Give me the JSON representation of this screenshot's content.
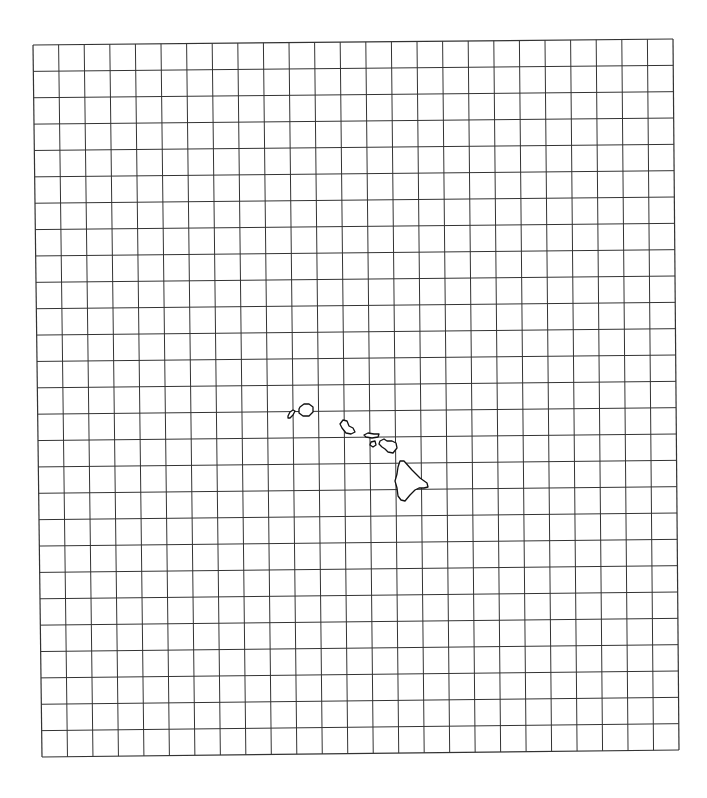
{
  "map": {
    "title": "",
    "background": "#ffffff",
    "grid": {
      "columns": 25,
      "rows": 27,
      "line_color": "#333333",
      "corners": {
        "top_left": [
          33,
          45
        ],
        "top_right": [
          673,
          39
        ],
        "bottom_left": [
          42,
          757
        ],
        "bottom_right": [
          679,
          750
        ]
      }
    },
    "islands": [
      {
        "name": "Niihau",
        "points": [
          [
            288,
            416
          ],
          [
            290,
            412
          ],
          [
            293,
            410
          ],
          [
            295,
            411
          ],
          [
            293,
            415
          ],
          [
            290,
            418
          ],
          [
            288,
            418
          ]
        ]
      },
      {
        "name": "Kauai",
        "points": [
          [
            300,
            407
          ],
          [
            304,
            404
          ],
          [
            309,
            404
          ],
          [
            313,
            407
          ],
          [
            313,
            412
          ],
          [
            309,
            416
          ],
          [
            303,
            416
          ],
          [
            299,
            413
          ],
          [
            299,
            409
          ]
        ]
      },
      {
        "name": "Oahu",
        "points": [
          [
            343,
            420
          ],
          [
            347,
            421
          ],
          [
            349,
            426
          ],
          [
            353,
            428
          ],
          [
            355,
            432
          ],
          [
            351,
            434
          ],
          [
            346,
            433
          ],
          [
            342,
            428
          ],
          [
            340,
            424
          ]
        ]
      },
      {
        "name": "Molokai",
        "points": [
          [
            364,
            435
          ],
          [
            368,
            433
          ],
          [
            374,
            434
          ],
          [
            379,
            434
          ],
          [
            378,
            437
          ],
          [
            372,
            438
          ],
          [
            366,
            437
          ]
        ]
      },
      {
        "name": "Lanai",
        "points": [
          [
            371,
            442
          ],
          [
            375,
            441
          ],
          [
            376,
            445
          ],
          [
            373,
            447
          ],
          [
            370,
            445
          ]
        ]
      },
      {
        "name": "Maui",
        "points": [
          [
            380,
            441
          ],
          [
            384,
            439
          ],
          [
            387,
            441
          ],
          [
            392,
            441
          ],
          [
            396,
            443
          ],
          [
            397,
            448
          ],
          [
            393,
            453
          ],
          [
            388,
            452
          ],
          [
            385,
            449
          ],
          [
            382,
            447
          ],
          [
            379,
            444
          ]
        ]
      },
      {
        "name": "Hawaii",
        "points": [
          [
            400,
            461
          ],
          [
            404,
            461
          ],
          [
            412,
            470
          ],
          [
            420,
            478
          ],
          [
            427,
            483
          ],
          [
            428,
            487
          ],
          [
            424,
            488
          ],
          [
            419,
            488
          ],
          [
            415,
            490
          ],
          [
            410,
            495
          ],
          [
            405,
            501
          ],
          [
            401,
            500
          ],
          [
            398,
            496
          ],
          [
            397,
            488
          ],
          [
            395,
            481
          ],
          [
            397,
            474
          ],
          [
            398,
            467
          ]
        ]
      }
    ]
  }
}
